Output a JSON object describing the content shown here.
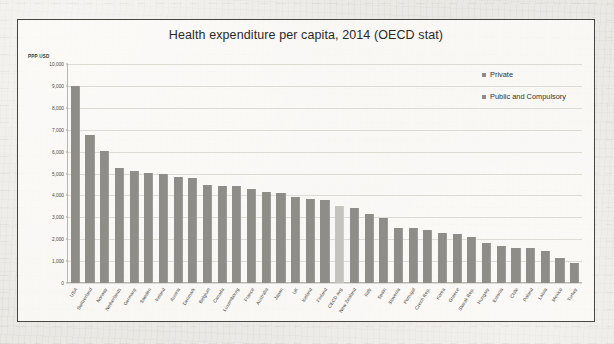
{
  "chart_data": {
    "type": "bar",
    "title": "Health expenditure per capita, 2014 (OECD stat)",
    "xlabel": "",
    "ylabel": "PPP USD",
    "ylim": [
      0,
      10000
    ],
    "ytick_labels": [
      "10,000",
      "9,000",
      "8,000",
      "7,000",
      "6,000",
      "5,000",
      "4,000",
      "3,000",
      "2,000",
      "1,000",
      "0"
    ],
    "ytick_values": [
      10000,
      9000,
      8000,
      7000,
      6000,
      5000,
      4000,
      3000,
      2000,
      1000,
      0
    ],
    "grid": true,
    "legend_position": "top-right",
    "legend": [
      {
        "label": "Private",
        "color": "#8f8d88"
      },
      {
        "label": "Public and Compulsory",
        "color": "#8f8d88"
      }
    ],
    "categories": [
      "USA",
      "Switzerland",
      "Norway",
      "Netherlands",
      "Germany",
      "Sweden",
      "Ireland",
      "Austria",
      "Denmark",
      "Belgium",
      "Canada",
      "Luxembourg",
      "France",
      "Australia",
      "Japan",
      "UK",
      "Iceland",
      "Finland",
      "OECD avg",
      "New Zealand",
      "Italy",
      "Spain",
      "Slovenia",
      "Portugal",
      "Czech Rep.",
      "Korea",
      "Greece",
      "Slovak Rep.",
      "Hungary",
      "Estonia",
      "Chile",
      "Poland",
      "Latvia",
      "Mexico",
      "Turkey"
    ],
    "values": [
      9000,
      6750,
      6050,
      5250,
      5100,
      5020,
      4960,
      4850,
      4800,
      4490,
      4450,
      4430,
      4300,
      4140,
      4100,
      3930,
      3820,
      3800,
      3530,
      3420,
      3150,
      2950,
      2500,
      2490,
      2400,
      2270,
      2240,
      2090,
      1850,
      1680,
      1610,
      1590,
      1470,
      1140,
      900
    ],
    "highlight_category": "OECD avg",
    "highlight_color": "#c5c3be",
    "bar_color": "#8f8d88"
  }
}
